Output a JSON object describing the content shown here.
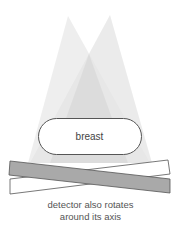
{
  "diagram": {
    "breast_label": "breast",
    "caption_line1": "detector also rotates",
    "caption_line2": "around its axis",
    "colors": {
      "beam_light": "#ebebeb",
      "beam_overlap": "#d4d4d4",
      "detector_gray": "#a8a8a8",
      "detector_white": "#ffffff",
      "outline": "#555555",
      "text": "#555555"
    }
  }
}
